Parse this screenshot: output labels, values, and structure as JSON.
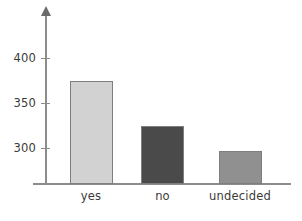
{
  "chart_data": {
    "type": "bar",
    "title": "",
    "subtitle": "",
    "xlabel": "",
    "ylabel": "",
    "categories": [
      "yes",
      "no",
      "undecided"
    ],
    "values": [
      375,
      324,
      297
    ],
    "series": [
      {
        "name": "responses",
        "values": [
          375,
          324,
          297
        ]
      }
    ],
    "bar_colors": [
      "#d2d2d2",
      "#4a4a4a",
      "#909090"
    ],
    "ytick_labels": [
      "300",
      "350",
      "400"
    ],
    "ytick_values": [
      300,
      350,
      400
    ],
    "ylim": [
      258,
      420
    ],
    "grid": false,
    "legend": null,
    "axis_color": "#8c8c8c",
    "text_color": "#3a3a3a"
  },
  "axis": {
    "y_arrow": "up-arrow-icon",
    "ticks": [
      {
        "label": "400",
        "value": 400
      },
      {
        "label": "350",
        "value": 350
      },
      {
        "label": "300",
        "value": 300
      }
    ]
  },
  "bars": [
    {
      "category": "yes",
      "value": 375,
      "color": "#d2d2d2"
    },
    {
      "category": "no",
      "value": 324,
      "color": "#4a4a4a"
    },
    {
      "category": "undecided",
      "value": 297,
      "color": "#909090"
    }
  ]
}
